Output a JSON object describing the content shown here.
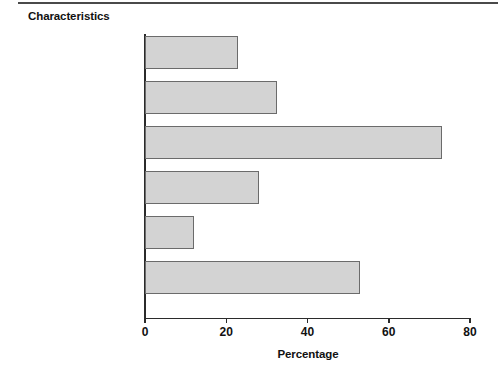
{
  "header": {
    "title": "Characteristics"
  },
  "chart_data": {
    "type": "bar",
    "orientation": "horizontal",
    "title": "Characteristics",
    "xlabel": "Percentage",
    "ylabel": "",
    "xlim": [
      0,
      80
    ],
    "xticks": [
      0,
      20,
      40,
      60,
      80
    ],
    "xtick_labels": [
      "0",
      "20",
      "40",
      "60",
      "80"
    ],
    "grid": false,
    "legend": null,
    "bar_color": "#d3d3d3",
    "bar_edge_color": "#6b6b6b",
    "categories": [
      "Age 41 or more",
      "Age 30 or under",
      "College, some university,\nor more",
      "High school degree\nor less",
      "Foreign parents",
      "Parents owned business"
    ],
    "values": [
      23,
      32.5,
      73,
      28,
      12,
      53
    ],
    "bars": [
      {
        "label": "Age 41 or more",
        "value": 23
      },
      {
        "label": "Age 30 or under",
        "value": 32.5
      },
      {
        "label": "College, some university,\nor more",
        "value": 73
      },
      {
        "label": "High school degree\nor less",
        "value": 28
      },
      {
        "label": "Foreign parents",
        "value": 12
      },
      {
        "label": "Parents owned business",
        "value": 53
      }
    ]
  }
}
